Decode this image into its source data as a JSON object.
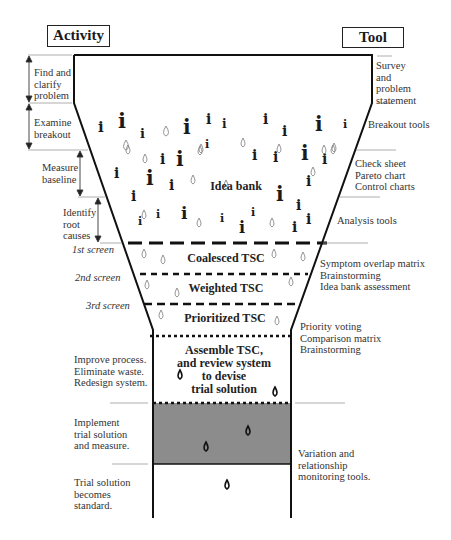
{
  "headers": {
    "activity": "Activity",
    "tool": "Tool"
  },
  "activities": [
    {
      "label": "Find and\nclarify\nproblem"
    },
    {
      "label": "Examine\nbreakout"
    },
    {
      "label": "Measure\nbaseline"
    },
    {
      "label": "Identify\nroot\ncauses"
    },
    {
      "label": "Improve process.\nEliminate waste.\nRedesign system."
    },
    {
      "label": "Implement\ntrial solution\nand measure."
    },
    {
      "label": "Trial solution\nbecomes\nstandard."
    }
  ],
  "screens": [
    "1st screen",
    "2nd screen",
    "3rd screen"
  ],
  "tools": [
    {
      "label": "Survey\nand\nproblem\nstatement"
    },
    {
      "label": "Breakout tools"
    },
    {
      "label": "Check sheet\nPareto chart\nControl charts"
    },
    {
      "label": "Analysis tools"
    },
    {
      "label": "Symptom overlap matrix\nBrainstorming\nIdea bank assessment"
    },
    {
      "label": "Priority voting\nComparison matrix\nBrainstorming"
    },
    {
      "label": "Variation and\nrelationship\nmonitoring tools."
    }
  ],
  "funnel_bands": {
    "idea_bank": "Idea bank",
    "coalesced": "Coalesced TSC",
    "weighted": "Weighted TSC",
    "prioritized": "Prioritized TSC",
    "assemble": "Assemble TSC,\nand review system\nto devise\ntrial solution"
  },
  "colors": {
    "shaded_band": "#8c8c8c",
    "outline": "#111111",
    "divider": "#999999"
  }
}
